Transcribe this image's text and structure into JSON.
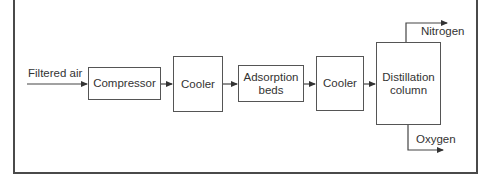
{
  "diagram": {
    "type": "process-flow",
    "input_label": "Filtered air",
    "stages": [
      {
        "id": "compressor",
        "label": "Compressor"
      },
      {
        "id": "cooler-1",
        "label": "Cooler"
      },
      {
        "id": "adsorption-beds",
        "label": "Adsorption beds",
        "line1": "Adsorption",
        "line2": "beds"
      },
      {
        "id": "cooler-2",
        "label": "Cooler"
      },
      {
        "id": "distillation-column",
        "label": "Distillation column",
        "line1": "Distillation",
        "line2": "column"
      }
    ],
    "outputs": [
      {
        "id": "nitrogen",
        "label": "Nitrogen"
      },
      {
        "id": "oxygen",
        "label": "Oxygen"
      }
    ],
    "colors": {
      "line": "#444444",
      "text": "#333333",
      "background": "#ffffff"
    }
  }
}
